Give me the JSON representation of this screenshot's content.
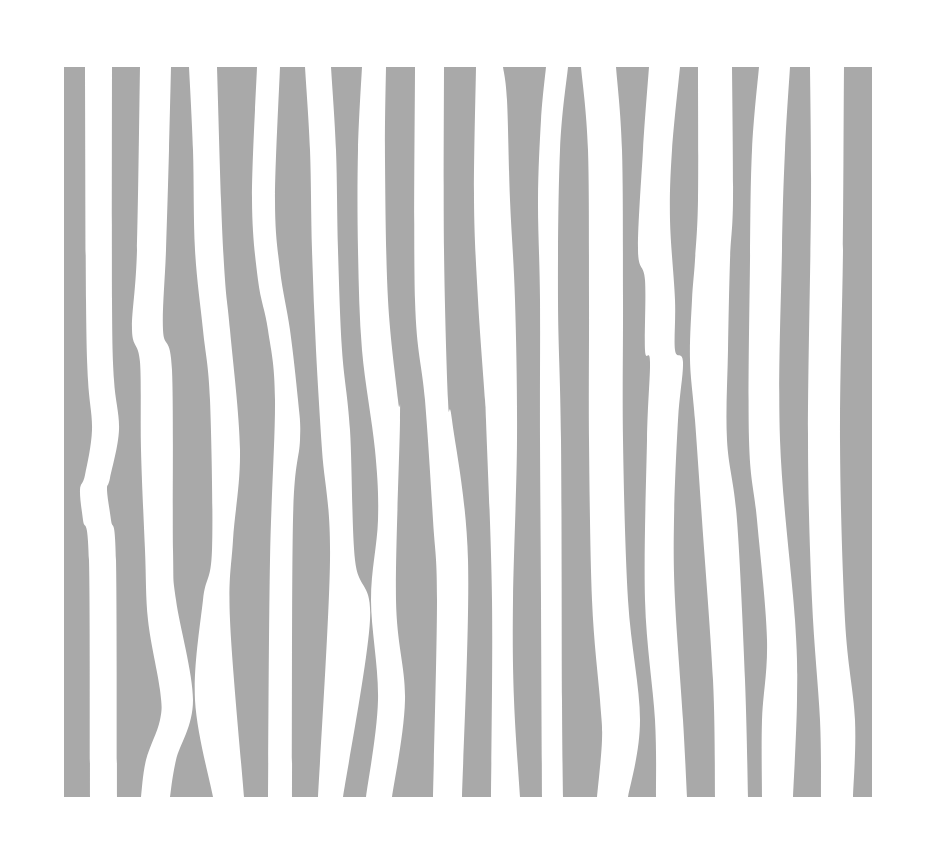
{
  "artwork": {
    "background_color": "#ffffff",
    "stripe_color": "#a9a9a9",
    "stripe_count": 15,
    "top_y": 67,
    "bottom_y": 797,
    "stripes": [
      {
        "id": 1,
        "left": [
          [
            64,
            67
          ],
          [
            64,
            300
          ],
          [
            64,
            500
          ],
          [
            64,
            797
          ]
        ],
        "right": [
          [
            85,
            67
          ],
          [
            86,
            300
          ],
          [
            88,
            380
          ],
          [
            92,
            430
          ],
          [
            85,
            475
          ],
          [
            80,
            490
          ],
          [
            83,
            520
          ],
          [
            89,
            560
          ],
          [
            90,
            797
          ]
        ]
      },
      {
        "id": 2,
        "left": [
          [
            112,
            67
          ],
          [
            112,
            300
          ],
          [
            114,
            380
          ],
          [
            119,
            430
          ],
          [
            110,
            478
          ],
          [
            107,
            490
          ],
          [
            111,
            520
          ],
          [
            116,
            560
          ],
          [
            117,
            797
          ]
        ],
        "right": [
          [
            140,
            67
          ],
          [
            137,
            250
          ],
          [
            132,
            330
          ],
          [
            140,
            362
          ],
          [
            141,
            450
          ],
          [
            145,
            550
          ],
          [
            148,
            620
          ],
          [
            160,
            690
          ],
          [
            160,
            720
          ],
          [
            146,
            760
          ],
          [
            141,
            797
          ]
        ]
      },
      {
        "id": 3,
        "left": [
          [
            171,
            67
          ],
          [
            169,
            150
          ],
          [
            166,
            250
          ],
          [
            163,
            330
          ],
          [
            172,
            370
          ],
          [
            173,
            550
          ],
          [
            176,
            600
          ],
          [
            193,
            700
          ],
          [
            176,
            760
          ],
          [
            170,
            797
          ]
        ],
        "right": [
          [
            189,
            67
          ],
          [
            193,
            150
          ],
          [
            195,
            250
          ],
          [
            203,
            330
          ],
          [
            210,
            400
          ],
          [
            212,
            550
          ],
          [
            203,
            600
          ],
          [
            195,
            700
          ],
          [
            213,
            797
          ]
        ]
      },
      {
        "id": 4,
        "left": [
          [
            217,
            67
          ],
          [
            221,
            200
          ],
          [
            225,
            280
          ],
          [
            230,
            330
          ],
          [
            240,
            450
          ],
          [
            233,
            540
          ],
          [
            230,
            620
          ],
          [
            244,
            797
          ]
        ],
        "right": [
          [
            257,
            67
          ],
          [
            252,
            200
          ],
          [
            258,
            280
          ],
          [
            268,
            330
          ],
          [
            275,
            400
          ],
          [
            270,
            560
          ],
          [
            268,
            797
          ]
        ]
      },
      {
        "id": 5,
        "left": [
          [
            280,
            67
          ],
          [
            275,
            200
          ],
          [
            280,
            270
          ],
          [
            290,
            330
          ],
          [
            298,
            400
          ],
          [
            300,
            440
          ],
          [
            293,
            520
          ],
          [
            292,
            797
          ]
        ],
        "right": [
          [
            305,
            67
          ],
          [
            310,
            150
          ],
          [
            312,
            250
          ],
          [
            316,
            350
          ],
          [
            322,
            450
          ],
          [
            330,
            560
          ],
          [
            318,
            797
          ]
        ]
      },
      {
        "id": 6,
        "left": [
          [
            331,
            67
          ],
          [
            336,
            150
          ],
          [
            338,
            250
          ],
          [
            342,
            350
          ],
          [
            350,
            430
          ],
          [
            355,
            560
          ],
          [
            370,
            620
          ],
          [
            343,
            797
          ]
        ],
        "right": [
          [
            362,
            67
          ],
          [
            358,
            150
          ],
          [
            358,
            250
          ],
          [
            362,
            350
          ],
          [
            375,
            450
          ],
          [
            378,
            520
          ],
          [
            371,
            600
          ],
          [
            378,
            700
          ],
          [
            366,
            797
          ]
        ]
      },
      {
        "id": 7,
        "left": [
          [
            386,
            67
          ],
          [
            385,
            160
          ],
          [
            388,
            300
          ],
          [
            398,
            400
          ],
          [
            400,
            420
          ],
          [
            396,
            600
          ],
          [
            405,
            700
          ],
          [
            392,
            797
          ]
        ],
        "right": [
          [
            415,
            67
          ],
          [
            415,
            300
          ],
          [
            425,
            400
          ],
          [
            433,
            520
          ],
          [
            437,
            600
          ],
          [
            433,
            797
          ]
        ]
      },
      {
        "id": 8,
        "left": [
          [
            444,
            67
          ],
          [
            444,
            250
          ],
          [
            448,
            400
          ],
          [
            452,
            420
          ],
          [
            468,
            560
          ],
          [
            462,
            797
          ]
        ],
        "right": [
          [
            476,
            67
          ],
          [
            474,
            200
          ],
          [
            478,
            300
          ],
          [
            485,
            400
          ],
          [
            486,
            420
          ],
          [
            492,
            600
          ],
          [
            491,
            797
          ]
        ]
      },
      {
        "id": 9,
        "left": [
          [
            503,
            67
          ],
          [
            507,
            100
          ],
          [
            510,
            200
          ],
          [
            515,
            300
          ],
          [
            517,
            440
          ],
          [
            513,
            600
          ],
          [
            514,
            700
          ],
          [
            520,
            797
          ]
        ],
        "right": [
          [
            546,
            67
          ],
          [
            541,
            120
          ],
          [
            538,
            200
          ],
          [
            540,
            300
          ],
          [
            540,
            440
          ],
          [
            541,
            600
          ],
          [
            542,
            797
          ]
        ]
      },
      {
        "id": 10,
        "left": [
          [
            568,
            67
          ],
          [
            560,
            150
          ],
          [
            558,
            300
          ],
          [
            561,
            440
          ],
          [
            562,
            700
          ],
          [
            563,
            797
          ]
        ],
        "right": [
          [
            581,
            67
          ],
          [
            588,
            150
          ],
          [
            589,
            300
          ],
          [
            589,
            440
          ],
          [
            592,
            600
          ],
          [
            600,
            700
          ],
          [
            602,
            740
          ],
          [
            597,
            797
          ]
        ]
      },
      {
        "id": 11,
        "left": [
          [
            616,
            67
          ],
          [
            622,
            150
          ],
          [
            623,
            300
          ],
          [
            623,
            440
          ],
          [
            628,
            600
          ],
          [
            640,
            720
          ],
          [
            628,
            797
          ]
        ],
        "right": [
          [
            649,
            67
          ],
          [
            643,
            150
          ],
          [
            638,
            250
          ],
          [
            645,
            280
          ],
          [
            645,
            350
          ],
          [
            650,
            362
          ],
          [
            647,
            440
          ],
          [
            645,
            600
          ],
          [
            655,
            720
          ],
          [
            656,
            797
          ]
        ]
      },
      {
        "id": 12,
        "left": [
          [
            680,
            67
          ],
          [
            672,
            150
          ],
          [
            670,
            220
          ],
          [
            675,
            300
          ],
          [
            675,
            350
          ],
          [
            683,
            362
          ],
          [
            678,
            420
          ],
          [
            674,
            520
          ],
          [
            675,
            600
          ],
          [
            683,
            720
          ],
          [
            687,
            797
          ]
        ],
        "right": [
          [
            698,
            67
          ],
          [
            698,
            200
          ],
          [
            695,
            260
          ],
          [
            692,
            300
          ],
          [
            690,
            360
          ],
          [
            695,
            420
          ],
          [
            702,
            520
          ],
          [
            713,
            680
          ],
          [
            715,
            797
          ]
        ]
      },
      {
        "id": 13,
        "left": [
          [
            732,
            67
          ],
          [
            733,
            200
          ],
          [
            730,
            260
          ],
          [
            728,
            350
          ],
          [
            727,
            440
          ],
          [
            737,
            520
          ],
          [
            745,
            680
          ],
          [
            748,
            797
          ]
        ],
        "right": [
          [
            759,
            67
          ],
          [
            752,
            150
          ],
          [
            750,
            260
          ],
          [
            749,
            440
          ],
          [
            757,
            520
          ],
          [
            767,
            640
          ],
          [
            762,
            720
          ],
          [
            762,
            797
          ]
        ]
      },
      {
        "id": 14,
        "left": [
          [
            790,
            67
          ],
          [
            785,
            150
          ],
          [
            782,
            250
          ],
          [
            780,
            440
          ],
          [
            795,
            620
          ],
          [
            797,
            700
          ],
          [
            793,
            797
          ]
        ],
        "right": [
          [
            810,
            67
          ],
          [
            811,
            200
          ],
          [
            808,
            440
          ],
          [
            812,
            600
          ],
          [
            820,
            720
          ],
          [
            821,
            797
          ]
        ]
      },
      {
        "id": 15,
        "left": [
          [
            844,
            67
          ],
          [
            843,
            250
          ],
          [
            840,
            440
          ],
          [
            845,
            620
          ],
          [
            855,
            720
          ],
          [
            853,
            797
          ]
        ],
        "right": [
          [
            872,
            67
          ],
          [
            872,
            440
          ],
          [
            872,
            620
          ],
          [
            872,
            797
          ]
        ]
      }
    ]
  }
}
